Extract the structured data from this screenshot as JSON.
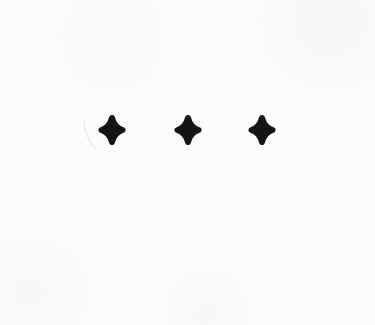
{
  "canvas": {
    "width": 375,
    "height": 325,
    "background": "#fcfcfb",
    "description": "scanned white paper with three black four-pointed stars in a row"
  },
  "colors": {
    "star": "#141414",
    "artifact": "#dcdcd8"
  },
  "stars": [
    {
      "label": "star-1",
      "cx": 112,
      "cy": 130,
      "transform": "translate(112,130)"
    },
    {
      "label": "star-2",
      "cx": 188,
      "cy": 130,
      "transform": "translate(188,130)"
    },
    {
      "label": "star-3",
      "cx": 262,
      "cy": 130,
      "transform": "translate(262,130)"
    }
  ],
  "artifact": {
    "path": "M 84 122 Q 85 138 96 149"
  }
}
